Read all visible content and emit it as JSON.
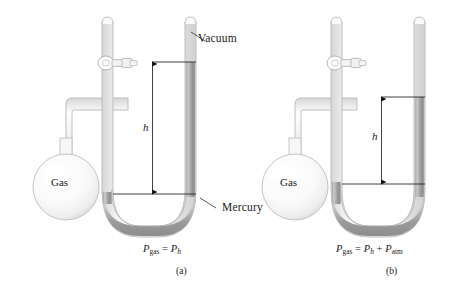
{
  "figure": {
    "panels": [
      {
        "id": "a",
        "caption": "(a)",
        "type": "closed-end manometer",
        "bulb_label": "Gas",
        "height_label": "h",
        "tube_top_label": "Vacuum",
        "liquid_label": "Mercury",
        "equation": {
          "lhs_main": "P",
          "lhs_sub": "gas",
          "op": "=",
          "terms": [
            {
              "main": "P",
              "sub": "h",
              "italic_sub": true
            }
          ]
        }
      },
      {
        "id": "b",
        "caption": "(b)",
        "type": "open-end manometer",
        "bulb_label": "Gas",
        "height_label": "h",
        "tube_top_label": "",
        "liquid_label": "",
        "equation": {
          "lhs_main": "P",
          "lhs_sub": "gas",
          "op": "=",
          "terms": [
            {
              "main": "P",
              "sub": "h",
              "italic_sub": true
            },
            {
              "main": "P",
              "sub": "atm",
              "italic_sub": false
            }
          ]
        }
      }
    ]
  },
  "colors": {
    "glass_outline": "#b9b9b9",
    "glass_fill": "#f6f6f6",
    "glass_highlight": "#ffffff",
    "mercury_dark": "#8d8d8d",
    "mercury_mid": "#a8a8a8",
    "mercury_light": "#cfcfcf",
    "bulb_fill": "#fbfbfb",
    "bulb_edge": "#c4c4c4",
    "annotation": "#111111",
    "text": "#1a1a1a",
    "background": "#ffffff"
  },
  "annotations": {
    "plus_sign": "+",
    "equals_sign": "="
  }
}
